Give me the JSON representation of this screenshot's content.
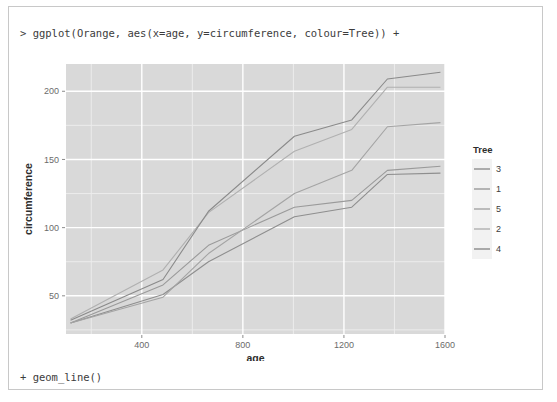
{
  "console": {
    "input_line": "> ggplot(Orange, aes(x=age, y=circumference, colour=Tree)) +",
    "continuation_line": "+ geom_line()"
  },
  "chart_data": {
    "type": "line",
    "title": "",
    "xlabel": "age",
    "ylabel": "circumference",
    "xlim": [
      100,
      1600
    ],
    "ylim": [
      22,
      220
    ],
    "xticks": [
      400,
      800,
      1200,
      1600
    ],
    "yticks": [
      50,
      100,
      150,
      200
    ],
    "grid": true,
    "panel_bg": "#d9d9d9",
    "grid_major": "#ffffff",
    "grid_minor": "#ececec",
    "legend": {
      "title": "Tree",
      "position": "right",
      "entries": [
        {
          "label": "3",
          "color": "#8e8e8e"
        },
        {
          "label": "1",
          "color": "#9a9a9a"
        },
        {
          "label": "5",
          "color": "#a4a4a4"
        },
        {
          "label": "2",
          "color": "#b0b0b0"
        },
        {
          "label": "4",
          "color": "#8a8a8a"
        }
      ]
    },
    "x": [
      118,
      484,
      664,
      1004,
      1231,
      1372,
      1582
    ],
    "series": [
      {
        "name": "3",
        "color": "#8e8e8e",
        "values": [
          30,
          51,
          75,
          108,
          115,
          139,
          140
        ]
      },
      {
        "name": "1",
        "color": "#9a9a9a",
        "values": [
          30,
          58,
          87,
          115,
          120,
          142,
          145
        ]
      },
      {
        "name": "5",
        "color": "#a4a4a4",
        "values": [
          30,
          49,
          81,
          125,
          142,
          174,
          177
        ]
      },
      {
        "name": "2",
        "color": "#b0b0b0",
        "values": [
          33,
          69,
          111,
          156,
          172,
          203,
          203
        ]
      },
      {
        "name": "4",
        "color": "#8a8a8a",
        "values": [
          32,
          62,
          112,
          167,
          179,
          209,
          214
        ]
      }
    ]
  }
}
